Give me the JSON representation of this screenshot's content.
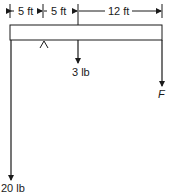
{
  "dimensions": {
    "seg1": "5 ft",
    "seg2": "5 ft",
    "seg3": "12 ft"
  },
  "forces": {
    "left_end": "20 lb",
    "middle": "3 lb",
    "right_end": "F"
  },
  "colors": {
    "line": "#1a1a1a",
    "background": "#ffffff"
  }
}
